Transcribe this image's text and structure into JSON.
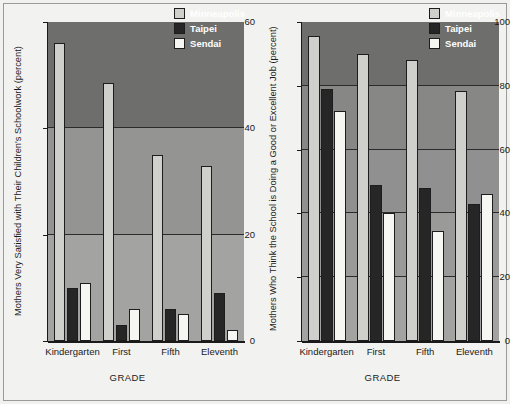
{
  "figure": {
    "background": "#f2f2f0",
    "panel_background": "#8d8d8d"
  },
  "legend": {
    "position": "top-right",
    "entries": [
      {
        "label": "Minneapolis",
        "color": "#cfcfcb",
        "key": "minneapolis"
      },
      {
        "label": "Taipei",
        "color": "#262626",
        "key": "taipei"
      },
      {
        "label": "Sendai",
        "color": "#f6f6f2",
        "key": "sendai"
      }
    ]
  },
  "chart_data": [
    {
      "type": "bar",
      "panel": "left",
      "title": "",
      "xlabel": "GRADE",
      "ylabel": "Mothers Very Satisfied with Their Children's Schoolwork (percent)",
      "categories": [
        "Kindergarten",
        "First",
        "Fifth",
        "Eleventh"
      ],
      "ylim": [
        0,
        60
      ],
      "yticks": [
        0,
        20,
        40,
        60
      ],
      "ytick_labels": [
        "0",
        "20",
        "40",
        "60"
      ],
      "grid": true,
      "legend_position": "top-right",
      "series": [
        {
          "name": "Minneapolis",
          "color": "#cfcfcb",
          "values": [
            56,
            48.5,
            35,
            33
          ]
        },
        {
          "name": "Taipei",
          "color": "#262626",
          "values": [
            10,
            3,
            6,
            9
          ]
        },
        {
          "name": "Sendai",
          "color": "#f6f6f2",
          "values": [
            11,
            6,
            5,
            2
          ]
        }
      ]
    },
    {
      "type": "bar",
      "panel": "right",
      "title": "",
      "xlabel": "GRADE",
      "ylabel": "Mothers Who Think the School is Doing a Good or Excellent Job (percent)",
      "categories": [
        "Kindergarten",
        "First",
        "Fifth",
        "Eleventh"
      ],
      "ylim": [
        0,
        100
      ],
      "yticks": [
        0,
        20,
        40,
        60,
        80,
        100
      ],
      "ytick_labels": [
        "0",
        "20",
        "40",
        "60",
        "80",
        "100"
      ],
      "grid": true,
      "legend_position": "top-right",
      "series": [
        {
          "name": "Minneapolis",
          "color": "#cfcfcb",
          "values": [
            95.5,
            90,
            88,
            78.5
          ]
        },
        {
          "name": "Taipei",
          "color": "#262626",
          "values": [
            79,
            49,
            48,
            43
          ]
        },
        {
          "name": "Sendai",
          "color": "#f6f6f2",
          "values": [
            72,
            40,
            34.5,
            46
          ]
        }
      ]
    }
  ]
}
